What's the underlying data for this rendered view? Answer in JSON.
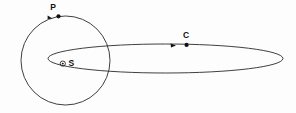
{
  "figure": {
    "background_color": "#fdfdfd",
    "stroke_color": "#2a2a2a",
    "marker_color": "#111111",
    "width": 296,
    "height": 113
  },
  "labels": {
    "planet": "P",
    "comet": "C",
    "sun": "S",
    "sun_symbol": "⊙"
  },
  "orbits": [
    {
      "id": "circular-orbit",
      "name": "planet-orbit",
      "shape": "circle",
      "center_x": 65.5,
      "center_y": 60.5,
      "radius": 44.5
    },
    {
      "id": "elliptical-orbit",
      "name": "comet-orbit",
      "shape": "ellipse",
      "center_x": 165.5,
      "center_y": 58.5,
      "radius_x": 117.5,
      "radius_y": 14.5
    }
  ],
  "points": [
    {
      "id": "point-p",
      "label": "P",
      "x": 58.5,
      "y": 16.5,
      "label_x": 53.0,
      "label_y": 7.0,
      "arrow_x": 50.5,
      "arrow_y": 18.5,
      "arrow_angle": -165
    },
    {
      "id": "point-c",
      "label": "C",
      "x": 186.5,
      "y": 45.0,
      "label_x": 186.0,
      "label_y": 35.0,
      "arrow_x": 178.0,
      "arrow_y": 45.8,
      "arrow_angle": 182
    },
    {
      "id": "point-sun",
      "label": "S",
      "x": 63.0,
      "y": 63.5,
      "label_x": 69.5,
      "label_y": 63.5,
      "symbol_radius": 2.6,
      "core_radius": 0.9
    }
  ]
}
